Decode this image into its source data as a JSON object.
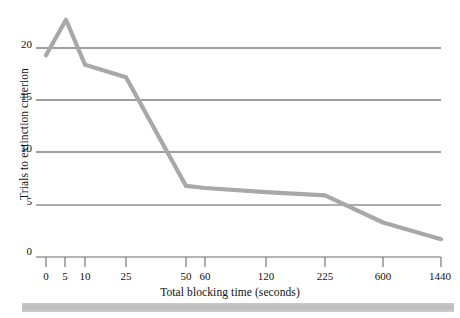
{
  "chart_data": {
    "type": "line",
    "title": "",
    "subtitle": "",
    "xlabel": "Total blocking time (seconds)",
    "ylabel": "Trials to extinction criterion",
    "categories": [
      "0",
      "5",
      "10",
      "25",
      "50",
      "60",
      "120",
      "225",
      "600",
      "1440"
    ],
    "x_tick_labels": [
      "0",
      "5",
      "10",
      "25",
      "50",
      "60",
      "120",
      "225",
      "600",
      "1440"
    ],
    "y_tick_labels": [
      "0",
      "5",
      "10",
      "15",
      "20"
    ],
    "y_ticks": [
      0,
      5,
      10,
      15,
      20
    ],
    "ylim": [
      0,
      24
    ],
    "grid": "horizontal",
    "legend": "none",
    "line_color": "#a8a8a8",
    "grid_color": "#4a4a4a",
    "axis_color": "#555555",
    "series": [
      {
        "name": "Trials to extinction criterion",
        "values": [
          19.3,
          22.7,
          18.4,
          17.2,
          6.8,
          6.6,
          6.2,
          5.9,
          3.3,
          1.7
        ]
      }
    ],
    "annotations": []
  },
  "figure": {
    "bottom_bar_label": "page-edge-shadow"
  }
}
